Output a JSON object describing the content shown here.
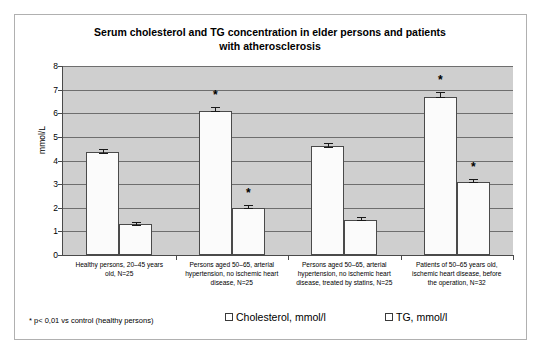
{
  "chart_data": {
    "type": "bar",
    "title": "Serum cholesterol and TG concentration  in elder persons and patients with atherosclerosis",
    "title_line1": "Serum cholesterol and TG concentration  in elder persons and patients",
    "title_line2": "with atherosclerosis",
    "xlabel": "",
    "ylabel": "mmol/L",
    "ylim": [
      0,
      8
    ],
    "yticks": [
      0,
      1,
      2,
      3,
      4,
      5,
      6,
      7,
      8
    ],
    "ytick_labels": [
      "0",
      "1",
      "2",
      "3",
      "4",
      "5",
      "6",
      "7",
      "8"
    ],
    "grid": true,
    "legend_position": "bottom-right",
    "categories": [
      "Healthy persons, 20–45 years old, N=25",
      "Persons aged 50–65, arterial hypertension, no ischemic heart disease, N=25",
      "Persons aged 50–65, arterial hypertension, no ischemic heart disease, treated by statins, N=25",
      "Patients of 50–65 years old, ischemic heart disease, before the operation, N=32"
    ],
    "category_lines": [
      [
        "Healthy persons, 20–45 years",
        "old, N=25"
      ],
      [
        "Persons aged 50–65, arterial",
        "hypertension, no ischemic heart",
        "disease, N=25"
      ],
      [
        "Persons aged 50–65, arterial",
        "hypertension, no ischemic heart",
        "disease, treated by statins, N=25"
      ],
      [
        "Patients of 50–65 years old,",
        "ischemic heart disease, before",
        "the operation, N=32"
      ]
    ],
    "series": [
      {
        "name": "Cholesterol, mmol/l",
        "values": [
          4.35,
          6.1,
          4.6,
          6.7
        ],
        "errors": [
          0.12,
          0.15,
          0.15,
          0.2
        ],
        "significant": [
          false,
          true,
          false,
          true
        ]
      },
      {
        "name": "TG, mmol/l",
        "values": [
          1.3,
          2.0,
          1.5,
          3.1
        ],
        "errors": [
          0.1,
          0.1,
          0.1,
          0.12
        ],
        "significant": [
          false,
          true,
          false,
          true
        ]
      }
    ],
    "significance_marker": "*",
    "footnote": "* p< 0,01 vs control (healthy persons)",
    "colors": {
      "plot_background": "#cfcfcf",
      "bar_fill": "#fbfbfb",
      "bar_border": "#4a4a4a",
      "gridline": "#6e6e6e",
      "frame": "#b0b0b0",
      "text": "#000000"
    }
  }
}
